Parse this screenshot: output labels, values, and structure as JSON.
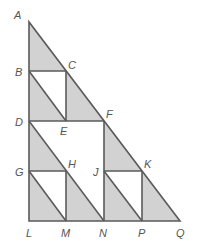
{
  "diagram": {
    "type": "geometric-figure",
    "colors": {
      "fill": "#d2d2d2",
      "stroke": "#5a5a5a",
      "label": "#555555",
      "background": "#ffffff"
    },
    "points": {
      "A": [
        29,
        22
      ],
      "B": [
        29,
        71
      ],
      "C": [
        66,
        71
      ],
      "D": [
        29,
        121
      ],
      "E": [
        66,
        121
      ],
      "F": [
        104,
        121
      ],
      "G": [
        29,
        171
      ],
      "H": [
        66,
        171
      ],
      "J": [
        104,
        171
      ],
      "K": [
        142,
        171
      ],
      "L": [
        29,
        221
      ],
      "M": [
        66,
        221
      ],
      "N": [
        104,
        221
      ],
      "P": [
        142,
        221
      ],
      "Q": [
        180,
        221
      ]
    },
    "labels": [
      {
        "text": "A",
        "x": 14,
        "y": 19
      },
      {
        "text": "B",
        "x": 15,
        "y": 76
      },
      {
        "text": "C",
        "x": 68,
        "y": 69
      },
      {
        "text": "D",
        "x": 15,
        "y": 126
      },
      {
        "text": "E",
        "x": 60,
        "y": 135
      },
      {
        "text": "F",
        "x": 106,
        "y": 118
      },
      {
        "text": "G",
        "x": 15,
        "y": 176
      },
      {
        "text": "H",
        "x": 68,
        "y": 168
      },
      {
        "text": "J",
        "x": 93,
        "y": 176
      },
      {
        "text": "K",
        "x": 144,
        "y": 168
      },
      {
        "text": "L",
        "x": 26,
        "y": 237
      },
      {
        "text": "M",
        "x": 61,
        "y": 237
      },
      {
        "text": "N",
        "x": 99,
        "y": 237
      },
      {
        "text": "P",
        "x": 138,
        "y": 237
      },
      {
        "text": "Q",
        "x": 176,
        "y": 237
      }
    ]
  }
}
